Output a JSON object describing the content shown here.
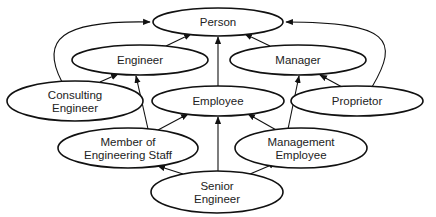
{
  "diagram": {
    "type": "inheritance-hierarchy",
    "nodes": [
      {
        "id": "person",
        "lines": [
          "Person"
        ],
        "cx": 218,
        "cy": 22,
        "rx": 65,
        "ry": 14
      },
      {
        "id": "engineer",
        "lines": [
          "Engineer"
        ],
        "cx": 140,
        "cy": 60,
        "rx": 68,
        "ry": 15
      },
      {
        "id": "manager",
        "lines": [
          "Manager"
        ],
        "cx": 298,
        "cy": 60,
        "rx": 68,
        "ry": 15
      },
      {
        "id": "consulting-engineer",
        "lines": [
          "Consulting",
          "Engineer"
        ],
        "cx": 75,
        "cy": 101,
        "rx": 68,
        "ry": 20
      },
      {
        "id": "employee",
        "lines": [
          "Employee"
        ],
        "cx": 218,
        "cy": 101,
        "rx": 66,
        "ry": 15
      },
      {
        "id": "proprietor",
        "lines": [
          "Proprietor"
        ],
        "cx": 357,
        "cy": 101,
        "rx": 66,
        "ry": 15
      },
      {
        "id": "member-of-engineering-staff",
        "lines": [
          "Member of",
          "Engineering Staff"
        ],
        "cx": 128,
        "cy": 148,
        "rx": 70,
        "ry": 20
      },
      {
        "id": "management-employee",
        "lines": [
          "Management",
          "Employee"
        ],
        "cx": 301,
        "cy": 148,
        "rx": 66,
        "ry": 20
      },
      {
        "id": "senior-engineer",
        "lines": [
          "Senior",
          "Engineer"
        ],
        "cx": 217,
        "cy": 192,
        "rx": 66,
        "ry": 21
      }
    ],
    "edges": [
      {
        "from": "engineer",
        "to": "person",
        "d": "M166,46 L191,34"
      },
      {
        "from": "manager",
        "to": "person",
        "d": "M270,46 L245,34"
      },
      {
        "from": "employee",
        "to": "person",
        "d": "M218,86 L218,37"
      },
      {
        "from": "consulting-engineer",
        "to": "person",
        "d": "M62,82 C40,40 60,20 150,22"
      },
      {
        "from": "proprietor",
        "to": "person",
        "d": "M372,87 C400,40 390,22 286,22"
      },
      {
        "from": "consulting-engineer",
        "to": "engineer",
        "d": "M100,82 L118,74"
      },
      {
        "from": "proprietor",
        "to": "manager",
        "d": "M342,87 L320,75"
      },
      {
        "from": "member-of-engineering-staff",
        "to": "engineer",
        "d": "M148,129 L136,76"
      },
      {
        "from": "member-of-engineering-staff",
        "to": "employee",
        "d": "M158,130 L188,114"
      },
      {
        "from": "management-employee",
        "to": "manager",
        "d": "M288,129 L299,76"
      },
      {
        "from": "management-employee",
        "to": "employee",
        "d": "M278,131 L248,114"
      },
      {
        "from": "senior-engineer",
        "to": "member-of-engineering-staff",
        "d": "M183,174 L158,166"
      },
      {
        "from": "senior-engineer",
        "to": "employee",
        "d": "M218,171 L218,117"
      },
      {
        "from": "senior-engineer",
        "to": "management-employee",
        "d": "M250,174 L276,163"
      }
    ]
  }
}
